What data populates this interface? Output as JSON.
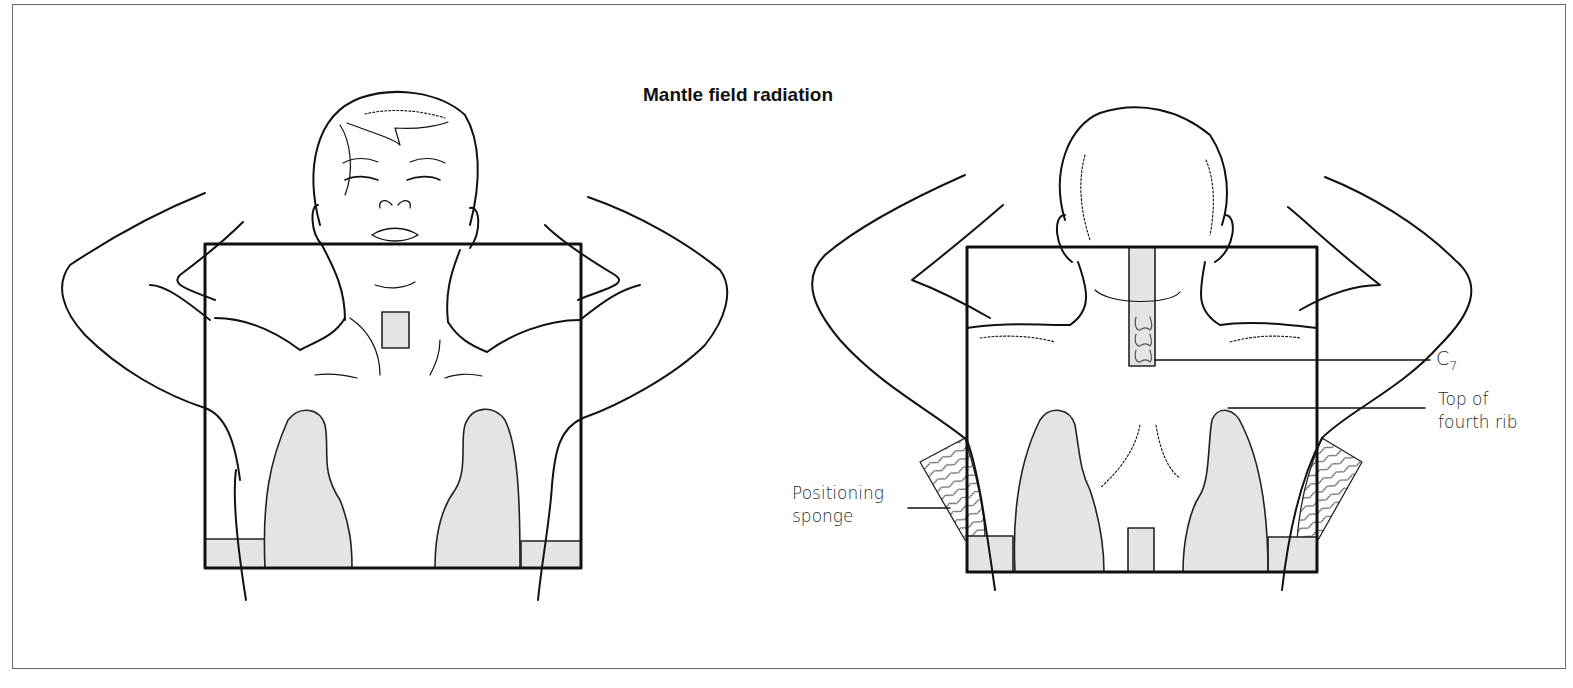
{
  "figure": {
    "title": "Mantle field radiation",
    "views": [
      {
        "name": "anterior",
        "description": "Front view of patient, arms raised, with mantle field rectangle, laryngeal block, lung blocks and lower shielding"
      },
      {
        "name": "posterior",
        "description": "Back view of patient, arms raised, with mantle field rectangle, spinal cord block, lung blocks, lower shielding and positioning sponges"
      }
    ],
    "labels": {
      "c7_letter": "C",
      "c7_subscript": "7",
      "rib_line1": "Top of",
      "rib_line2": "fourth rib",
      "sponge_line1": "Positioning",
      "sponge_line2": "sponge"
    }
  },
  "colors": {
    "line": "#111111",
    "shield_fill": "#e4e4e4",
    "frame": "#6b6b6b",
    "background": "#ffffff"
  }
}
